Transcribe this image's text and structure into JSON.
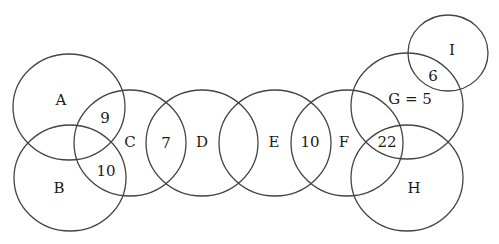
{
  "diagram": {
    "type": "overlapping-circles",
    "stroke_color": "#444444",
    "circles": [
      {
        "id": "A",
        "label": "A",
        "cx": 69,
        "cy": 107,
        "rx": 56,
        "ry": 53,
        "lx": 61,
        "ly": 100
      },
      {
        "id": "B",
        "label": "B",
        "cx": 70,
        "cy": 178,
        "rx": 56,
        "ry": 53,
        "lx": 59,
        "ly": 188
      },
      {
        "id": "C",
        "label": "C",
        "cx": 130,
        "cy": 143,
        "rx": 56,
        "ry": 53,
        "lx": 130,
        "ly": 142
      },
      {
        "id": "D",
        "label": "D",
        "cx": 202,
        "cy": 143,
        "rx": 56,
        "ry": 53,
        "lx": 202,
        "ly": 142
      },
      {
        "id": "E",
        "label": "E",
        "cx": 275,
        "cy": 143,
        "rx": 56,
        "ry": 53,
        "lx": 274,
        "ly": 142
      },
      {
        "id": "F",
        "label": "F",
        "cx": 347,
        "cy": 143,
        "rx": 56,
        "ry": 53,
        "lx": 344,
        "ly": 142
      },
      {
        "id": "G",
        "label": "G = 5",
        "cx": 407,
        "cy": 106,
        "rx": 56,
        "ry": 53,
        "lx": 410,
        "ly": 99
      },
      {
        "id": "H",
        "label": "H",
        "cx": 407,
        "cy": 178,
        "rx": 56,
        "ry": 53,
        "lx": 414,
        "ly": 188
      },
      {
        "id": "I",
        "label": "I",
        "cx": 448,
        "cy": 53,
        "rx": 40,
        "ry": 38,
        "lx": 452,
        "ly": 50
      }
    ],
    "intersections": [
      {
        "between": [
          "A",
          "C"
        ],
        "value": "9",
        "x": 105,
        "y": 118
      },
      {
        "between": [
          "B",
          "C"
        ],
        "value": "10",
        "x": 106,
        "y": 171
      },
      {
        "between": [
          "C",
          "D"
        ],
        "value": "7",
        "x": 166,
        "y": 143
      },
      {
        "between": [
          "E",
          "F"
        ],
        "value": "10",
        "x": 310,
        "y": 142
      },
      {
        "between": [
          "F",
          "G",
          "H"
        ],
        "value": "22",
        "x": 387,
        "y": 142
      },
      {
        "between": [
          "G",
          "I"
        ],
        "value": "6",
        "x": 433,
        "y": 76
      }
    ]
  }
}
